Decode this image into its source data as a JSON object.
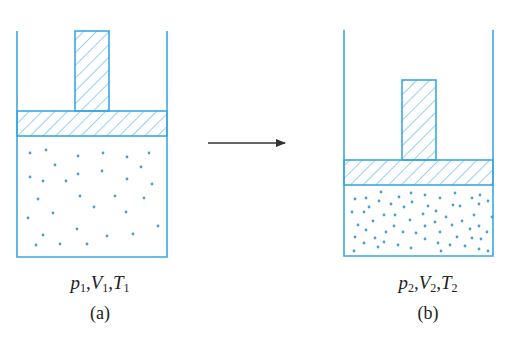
{
  "colors": {
    "stroke": "#3aa8e0",
    "hatch": "#5bb8e6",
    "particle": "#4a9fd0",
    "arrow": "#333333",
    "text": "#222222"
  },
  "panels": [
    {
      "id": "a",
      "caption": "(a)",
      "state": {
        "p": "p",
        "p_sub": "1",
        "V": "V",
        "V_sub": "1",
        "T": "T",
        "T_sub": "1"
      },
      "cylinder": {
        "left": 17,
        "right": 167,
        "top": 31,
        "bottom": 257
      },
      "piston": {
        "top": 111,
        "bottom": 136
      },
      "rod": {
        "left": 75,
        "right": 109,
        "top": 31
      },
      "particles": [
        [
          30,
          153
        ],
        [
          46,
          150
        ],
        [
          78,
          156
        ],
        [
          103,
          153
        ],
        [
          127,
          157
        ],
        [
          149,
          153
        ],
        [
          55,
          165
        ],
        [
          141,
          167
        ],
        [
          30,
          177
        ],
        [
          43,
          181
        ],
        [
          66,
          181
        ],
        [
          78,
          174
        ],
        [
          102,
          171
        ],
        [
          127,
          179
        ],
        [
          152,
          184
        ],
        [
          38,
          199
        ],
        [
          80,
          196
        ],
        [
          115,
          196
        ],
        [
          144,
          198
        ],
        [
          94,
          207
        ],
        [
          53,
          213
        ],
        [
          126,
          212
        ],
        [
          28,
          218
        ],
        [
          77,
          229
        ],
        [
          158,
          226
        ],
        [
          43,
          235
        ],
        [
          107,
          236
        ],
        [
          133,
          234
        ],
        [
          36,
          245
        ],
        [
          60,
          244
        ],
        [
          87,
          244
        ]
      ]
    },
    {
      "id": "b",
      "caption": "(b)",
      "state": {
        "p": "p",
        "p_sub": "2",
        "V": "V",
        "V_sub": "2",
        "T": "T",
        "T_sub": "2"
      },
      "cylinder": {
        "left": 344,
        "right": 493,
        "top": 30,
        "bottom": 256
      },
      "piston": {
        "top": 160,
        "bottom": 185
      },
      "rod": {
        "left": 402,
        "right": 436,
        "top": 80
      },
      "particles": [
        [
          381,
          192
        ],
        [
          355,
          199
        ],
        [
          366,
          198
        ],
        [
          379,
          201
        ],
        [
          399,
          197
        ],
        [
          411,
          193
        ],
        [
          412,
          202
        ],
        [
          369,
          207
        ],
        [
          391,
          204
        ],
        [
          404,
          207
        ],
        [
          352,
          212
        ],
        [
          364,
          212
        ],
        [
          384,
          215
        ],
        [
          395,
          215
        ],
        [
          410,
          220
        ],
        [
          373,
          221
        ],
        [
          358,
          225
        ],
        [
          394,
          226
        ],
        [
          366,
          230
        ],
        [
          386,
          232
        ],
        [
          403,
          232
        ],
        [
          416,
          233
        ],
        [
          355,
          237
        ],
        [
          375,
          238
        ],
        [
          364,
          243
        ],
        [
          384,
          242
        ],
        [
          398,
          245
        ],
        [
          378,
          247
        ],
        [
          411,
          248
        ],
        [
          354,
          251
        ],
        [
          425,
          195
        ],
        [
          440,
          198
        ],
        [
          455,
          193
        ],
        [
          472,
          198
        ],
        [
          480,
          195
        ],
        [
          428,
          206
        ],
        [
          436,
          211
        ],
        [
          453,
          205
        ],
        [
          460,
          206
        ],
        [
          479,
          204
        ],
        [
          488,
          201
        ],
        [
          423,
          214
        ],
        [
          446,
          217
        ],
        [
          474,
          215
        ],
        [
          492,
          217
        ],
        [
          435,
          222
        ],
        [
          462,
          221
        ],
        [
          425,
          226
        ],
        [
          452,
          225
        ],
        [
          479,
          226
        ],
        [
          470,
          229
        ],
        [
          440,
          232
        ],
        [
          487,
          232
        ],
        [
          425,
          239
        ],
        [
          457,
          237
        ],
        [
          472,
          238
        ],
        [
          481,
          239
        ],
        [
          438,
          243
        ],
        [
          450,
          245
        ],
        [
          465,
          246
        ],
        [
          479,
          249
        ],
        [
          488,
          251
        ],
        [
          441,
          251
        ]
      ]
    }
  ],
  "arrow": {
    "x1": 208,
    "x2": 285,
    "y": 143,
    "meaning": "process from state a to state b"
  }
}
